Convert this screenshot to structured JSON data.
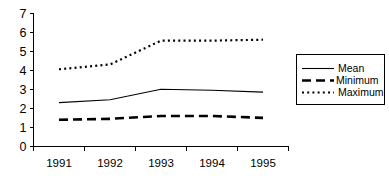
{
  "chart_data": {
    "type": "line",
    "title": "",
    "subtitle": "",
    "xlabel": "",
    "ylabel": "",
    "categories": [
      "1991",
      "1992",
      "1993",
      "1994",
      "1995"
    ],
    "series": [
      {
        "name": "Mean",
        "values": [
          2.3,
          2.45,
          3.0,
          2.95,
          2.85
        ],
        "style": "solid"
      },
      {
        "name": "Minimum",
        "values": [
          1.4,
          1.45,
          1.6,
          1.6,
          1.5
        ],
        "style": "dashed"
      },
      {
        "name": "Maximum",
        "values": [
          4.05,
          4.3,
          5.55,
          5.55,
          5.6
        ],
        "style": "dotted"
      }
    ],
    "ylim": [
      0,
      7
    ],
    "y_ticks": [
      "0",
      "1",
      "2",
      "3",
      "4",
      "5",
      "6",
      "7"
    ],
    "x_tick_labels": [
      "1991",
      "1992",
      "1993",
      "1994",
      "1995"
    ],
    "grid": false,
    "legend_position": "right",
    "legend_entries": [
      "Mean",
      "Minimum",
      "Maximum"
    ],
    "colors": {
      "mean": "#000000",
      "minimum": "#000000",
      "maximum": "#000000",
      "axis": "#000000",
      "background": "#ffffff"
    }
  }
}
